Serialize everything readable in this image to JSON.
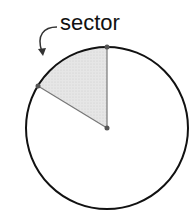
{
  "diagram": {
    "label": "sector",
    "circle": {
      "cx": 107,
      "cy": 128,
      "r": 81
    },
    "sector": {
      "start_point": [
        107,
        47
      ],
      "end_point": [
        38,
        86
      ],
      "fill": "#e3e3e3"
    },
    "colors": {
      "outline": "#111111",
      "radius": "#777777",
      "point": "#555555"
    }
  }
}
